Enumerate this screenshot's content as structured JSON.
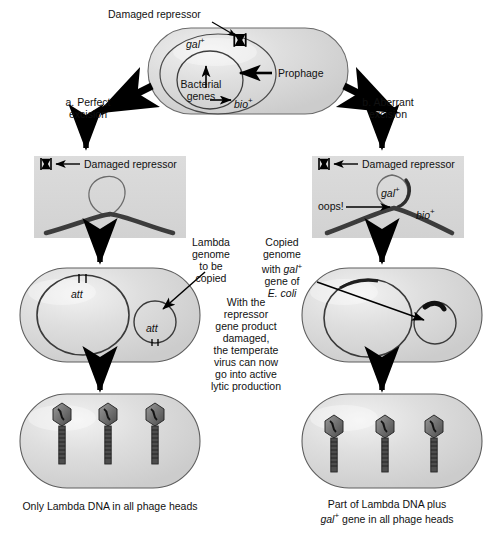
{
  "diagram": {
    "title_text_present": false,
    "colors": {
      "cell_fill": "#d9d9d9",
      "cell_stroke": "#555555",
      "box_fill": "#d6d6d6",
      "dna_thick": "#3a3a3a",
      "dna_thin": "#555555",
      "arrow": "#000000",
      "text": "#111111"
    },
    "top_cell": {
      "damaged_repressor_label": "Damaged repressor",
      "gal_label": "gal",
      "gal_superscript": "+",
      "bio_label": "bio",
      "bio_superscript": "+",
      "prophage_label": "Prophage",
      "bacterial_genes_label_line1": "Bacterial",
      "bacterial_genes_label_line2": "genes"
    },
    "branches": {
      "left_label_line1": "a. Perfect",
      "left_label_line2": "excision",
      "right_label_line1": "b. Aberrant",
      "right_label_line2": "excision"
    },
    "left_excision_box": {
      "damaged_repressor_label": "Damaged repressor"
    },
    "right_excision_box": {
      "damaged_repressor_label": "Damaged repressor",
      "oops_label": "oops!",
      "gal_label": "gal",
      "gal_superscript": "+",
      "bio_label": "bio",
      "bio_superscript": "+"
    },
    "left_cell_stage2": {
      "att_label_big": "att",
      "att_label_small": "att",
      "callout_line1": "Lambda",
      "callout_line2": "genome",
      "callout_line3": "to be",
      "callout_line4": "copied"
    },
    "right_cell_stage2": {
      "callout_line1": "Copied",
      "callout_line2": "genome",
      "callout_line3_pre": "with ",
      "callout_line3_ital": "gal",
      "callout_line3_sup": "+",
      "callout_line4": "gene of",
      "callout_line5": "E. coli"
    },
    "center_note": {
      "lines": [
        "With the",
        "repressor",
        "gene product",
        "damaged,",
        "the temperate",
        "virus can now",
        "go into active",
        "lytic production"
      ]
    },
    "bottom_left_caption": "Only Lambda DNA in all phage heads",
    "bottom_right_caption_line1": "Part of Lambda DNA plus",
    "bottom_right_caption_line2_ital": "gal",
    "bottom_right_caption_line2_sup": "+",
    "bottom_right_caption_line2_rest": " gene in all phage heads",
    "phage_count_left": 3,
    "phage_count_right": 3
  }
}
